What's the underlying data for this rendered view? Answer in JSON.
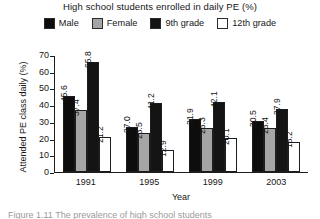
{
  "chart_data": {
    "type": "bar",
    "title": "High school students enrolled in daily PE (%)",
    "xlabel": "Year",
    "ylabel": "Attended PE class daily (%)",
    "categories": [
      "1991",
      "1995",
      "1999",
      "2003"
    ],
    "ylim": [
      0,
      70
    ],
    "yticks": [
      0,
      10,
      20,
      30,
      40,
      50,
      60,
      70
    ],
    "ytick_labels": [
      "0",
      "10",
      "20",
      "30",
      "40",
      "50",
      "60",
      "70"
    ],
    "grid": false,
    "legend_position": "top",
    "series": [
      {
        "name": "Male",
        "color": "#0d0d0d",
        "values": [
          45.6,
          27.0,
          31.9,
          30.5
        ],
        "labels": [
          "45.6",
          "27.0",
          "31.9",
          "30.5"
        ]
      },
      {
        "name": "Female",
        "color": "#a5a5a5",
        "values": [
          37.4,
          23.5,
          26.3,
          26.4
        ],
        "labels": [
          "37.4",
          "23.5",
          "26.3",
          "26.4"
        ]
      },
      {
        "name": "9th grade",
        "color": "#141414",
        "values": [
          65.8,
          41.2,
          42.1,
          37.9
        ],
        "labels": [
          "65.8",
          "41.2",
          "42.1",
          "37.9"
        ]
      },
      {
        "name": "12th grade",
        "color": "#ffffff",
        "values": [
          21.2,
          12.9,
          20.1,
          18.2
        ],
        "labels": [
          "21.2",
          "12.9",
          "20.1",
          "18.2"
        ]
      }
    ]
  },
  "caption": {
    "text": "Figure 1.11  The prevalence of high school students"
  }
}
